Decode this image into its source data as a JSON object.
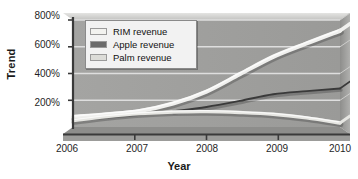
{
  "chart_data": {
    "type": "line",
    "title": "",
    "xlabel": "Year",
    "ylabel": "Trend",
    "xlim": [
      2006,
      2010
    ],
    "ylim": [
      0,
      800
    ],
    "x_ticks": [
      "2006",
      "2007",
      "2008",
      "2009",
      "2010"
    ],
    "x_tick_values": [
      2006,
      2007,
      2008,
      2009,
      2010
    ],
    "y_ticks": [
      "200%",
      "400%",
      "600%",
      "800%"
    ],
    "y_tick_values": [
      200,
      400,
      600,
      800
    ],
    "grid": true,
    "legend_position": "top-left",
    "style": "3d-grayscale-area-walls",
    "series": [
      {
        "name": "RIM revenue",
        "color": "#f0f0ee",
        "x": [
          2006,
          2006.5,
          2007,
          2007.5,
          2008,
          2008.5,
          2009,
          2009.5,
          2010
        ],
        "values": [
          75,
          95,
          120,
          175,
          265,
          395,
          525,
          625,
          720
        ]
      },
      {
        "name": "Apple revenue",
        "color": "#3a3a3a",
        "x": [
          2007.5,
          2008,
          2008.5,
          2009,
          2009.5,
          2010
        ],
        "values": [
          118,
          150,
          195,
          245,
          268,
          288
        ]
      },
      {
        "name": "Palm revenue",
        "color": "#e6e6e2",
        "x": [
          2006,
          2006.5,
          2007,
          2007.5,
          2008,
          2008.5,
          2009,
          2009.5,
          2010
        ],
        "values": [
          48,
          78,
          100,
          112,
          115,
          108,
          95,
          68,
          30
        ]
      }
    ]
  },
  "legend": {
    "items": [
      {
        "label": "RIM revenue",
        "swatch": "#f2f2ef"
      },
      {
        "label": "Apple revenue",
        "swatch": "#6b6b6b"
      },
      {
        "label": "Palm revenue",
        "swatch": "#dcdcd8"
      }
    ]
  },
  "axes": {
    "y_title": "Trend",
    "x_title": "Year",
    "y_tick_labels": [
      "800%",
      "600%",
      "400%",
      "200%"
    ],
    "x_tick_labels": [
      "2006",
      "2007",
      "2008",
      "2009",
      "2010"
    ]
  },
  "colors": {
    "plot_wall": "#9e9e9e",
    "plot_floor": "#8c8c8c",
    "top_face": "#d4d4d4",
    "side_face": "#9a9a9a",
    "gridline": "#d8d8d6",
    "axis_line": "#3d3d3d",
    "page_background": "#ffffff"
  }
}
